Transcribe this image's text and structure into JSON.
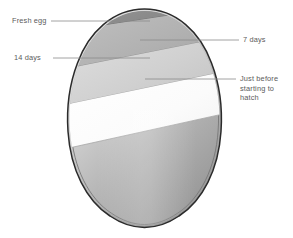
{
  "figure": {
    "background_color": "#ffffff"
  },
  "egg": {
    "outline_color": "#2b2b2b",
    "inner_outline_color": "#6e6e6e",
    "shell_fill_top": "#d6d6d6",
    "shell_fill_bottom": "#9a9a9a"
  },
  "bands": [
    {
      "id": "band-fresh-egg",
      "stage": "Fresh egg",
      "fill": "#8f8f8f",
      "description": "smallest air cell, darkest band at the top of the egg"
    },
    {
      "id": "band-7-days",
      "stage": "7 days",
      "fill": "#b4b4b4",
      "description": "air cell has grown, mid grey band"
    },
    {
      "id": "band-14-days",
      "stage": "14 days",
      "fill": "#d2d2d2",
      "description": "air cell larger still, light grey band"
    },
    {
      "id": "band-just-before-hatch",
      "stage": "Just before starting to hatch",
      "fill": "#fbfbfb",
      "description": "largest air cell, widest white band"
    }
  ],
  "callouts": [
    {
      "id": "callout-fresh-egg",
      "label": "Fresh egg",
      "side": "left",
      "leader_color": "#8c8c8c"
    },
    {
      "id": "callout-14-days",
      "label": "14 days",
      "side": "left",
      "leader_color": "#8c8c8c"
    },
    {
      "id": "callout-7-days",
      "label": "7 days",
      "side": "right",
      "leader_color": "#8c8c8c"
    },
    {
      "id": "callout-just-before-hatch",
      "label": "Just before\nstarting to\nhatch",
      "side": "right",
      "leader_color": "#8c8c8c"
    }
  ]
}
